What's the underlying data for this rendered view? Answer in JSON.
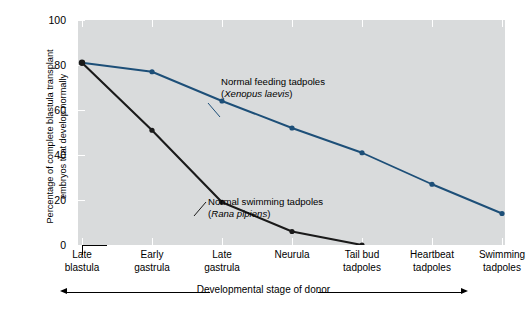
{
  "chart_data": {
    "type": "line",
    "title": "",
    "xlabel": "Developmental stage of donor",
    "ylabel": "Percentage of complete blastula transplant\nembryos that develop normally",
    "ylim": [
      0,
      100
    ],
    "yticks": [
      0,
      20,
      40,
      60,
      80,
      100
    ],
    "ytick_labels": [
      "0",
      "20",
      "40",
      "60",
      "80",
      "100"
    ],
    "grid": false,
    "legend_position": "inline-annotations",
    "categories": [
      "Late\nblastula",
      "Early\ngastrula",
      "Late\ngastrula",
      "Neurula",
      "Tail bud\ntadpoles",
      "Heartbeat\ntadpoles",
      "Swimming\ntadpoles"
    ],
    "series": [
      {
        "name": "Normal feeding tadpoles (Xenopus laevis)",
        "color": "#1d4f78",
        "values": [
          81,
          77,
          64,
          52,
          41,
          27,
          14
        ]
      },
      {
        "name": "Normal swimming tadpoles (Rana pipiens)",
        "color": "#1a1a1a",
        "values": [
          81,
          51,
          19,
          6,
          0,
          null,
          null
        ]
      }
    ],
    "annotations": [
      {
        "id": "xenopus",
        "line1": "Normal feeding tadpoles",
        "line2": "(Xenopus laevis)",
        "species_italic": "Xenopus laevis"
      },
      {
        "id": "rana",
        "line1": "Normal swimming tadpoles",
        "line2": "(Rana pipiens)",
        "species_italic": "Rana pipiens"
      }
    ],
    "plot_background_color": "#d9dbdc",
    "page_background_color": "#ffffff"
  },
  "axes": {
    "y_title": "Percentage of complete blastula transplant\nembryos that develop normally",
    "x_title": "Developmental stage of donor",
    "y_labels": {
      "t100": "100",
      "t80": "80",
      "t60": "60",
      "t40": "40",
      "t20": "20",
      "t0": "0"
    }
  },
  "x_categories": {
    "c0": "Late\nblastula",
    "c1": "Early\ngastrula",
    "c2": "Late\ngastrula",
    "c3": "Neurula",
    "c4": "Tail bud\ntadpoles",
    "c5": "Heartbeat\ntadpoles",
    "c6": "Swimming\ntadpoles"
  },
  "annotations": {
    "xenopus_line1": "Normal feeding tadpoles",
    "xenopus_line2_open": "(",
    "xenopus_species": "Xenopus laevis",
    "xenopus_line2_close": ")",
    "rana_line1": "Normal swimming tadpoles",
    "rana_line2_open": "(",
    "rana_species": "Rana pipiens",
    "rana_line2_close": ")"
  }
}
